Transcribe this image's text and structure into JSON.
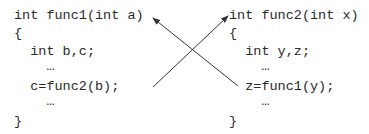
{
  "diagram": {
    "left_function": {
      "lines": [
        "int func1(int a)",
        "{",
        "  int b,c;",
        "    …",
        "  c=func2(b);",
        "    …",
        "}"
      ]
    },
    "right_function": {
      "lines": [
        "int func2(int x)",
        "{",
        "  int y,z;",
        "    …",
        "  z=func1(y);",
        "    …",
        "}"
      ]
    },
    "arrows": [
      {
        "from": "c=func2(b);",
        "to": "int func2(int x)"
      },
      {
        "from": "z=func1(y);",
        "to": "int func1(int a)"
      }
    ],
    "colors": {
      "text": "#2a2a2a",
      "arrow": "#333333",
      "background": "#ffffff"
    }
  }
}
